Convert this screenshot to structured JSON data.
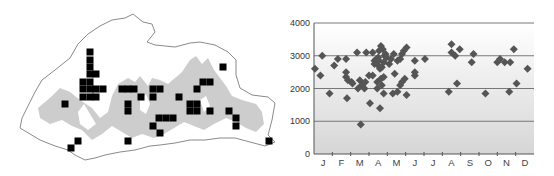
{
  "map": {
    "title": "",
    "outline_color": "#888888",
    "relief_color": "#cfcfcf",
    "marker_color": "#000000",
    "marker_size": 7,
    "records": [
      [
        90,
        52
      ],
      [
        90,
        60
      ],
      [
        90,
        67
      ],
      [
        90,
        74
      ],
      [
        96,
        74
      ],
      [
        83,
        82
      ],
      [
        90,
        82
      ],
      [
        83,
        89
      ],
      [
        90,
        89
      ],
      [
        96,
        89
      ],
      [
        103,
        89
      ],
      [
        83,
        97
      ],
      [
        90,
        97
      ],
      [
        96,
        97
      ],
      [
        65,
        104
      ],
      [
        122,
        89
      ],
      [
        128,
        89
      ],
      [
        134,
        89
      ],
      [
        141,
        97
      ],
      [
        128,
        104
      ],
      [
        128,
        111
      ],
      [
        153,
        89
      ],
      [
        160,
        89
      ],
      [
        153,
        97
      ],
      [
        179,
        97
      ],
      [
        159,
        118
      ],
      [
        166,
        118
      ],
      [
        173,
        118
      ],
      [
        153,
        126
      ],
      [
        160,
        133
      ],
      [
        128,
        141
      ],
      [
        78,
        141
      ],
      [
        71,
        148
      ],
      [
        223,
        67
      ],
      [
        203,
        82
      ],
      [
        210,
        82
      ],
      [
        197,
        89
      ],
      [
        190,
        104
      ],
      [
        197,
        104
      ],
      [
        190,
        111
      ],
      [
        197,
        111
      ],
      [
        210,
        111
      ],
      [
        229,
        111
      ],
      [
        236,
        118
      ],
      [
        236,
        126
      ],
      [
        269,
        141
      ]
    ]
  },
  "chart_data": {
    "type": "scatter",
    "title": "",
    "xlabel": "",
    "ylabel": "",
    "categories": [
      "J",
      "F",
      "M",
      "A",
      "M",
      "J",
      "J",
      "A",
      "S",
      "O",
      "N",
      "D"
    ],
    "yticks": [
      0,
      1000,
      2000,
      3000,
      4000
    ],
    "ylim": [
      0,
      4000
    ],
    "xlim": [
      0,
      12
    ],
    "grid": true,
    "marker_color": "#555555",
    "gridline_color": "#777777",
    "background_gradient": [
      "#ffffff",
      "#d8d8d8"
    ],
    "series": [
      {
        "name": "records",
        "points": [
          [
            0.05,
            2600
          ],
          [
            0.35,
            2400
          ],
          [
            0.45,
            3000
          ],
          [
            0.85,
            1850
          ],
          [
            1.1,
            2700
          ],
          [
            1.3,
            2900
          ],
          [
            1.75,
            2900
          ],
          [
            1.75,
            2500
          ],
          [
            1.75,
            2350
          ],
          [
            1.8,
            1700
          ],
          [
            1.85,
            2250
          ],
          [
            2.05,
            2200
          ],
          [
            2.1,
            2150
          ],
          [
            2.35,
            3100
          ],
          [
            2.4,
            2000
          ],
          [
            2.5,
            2250
          ],
          [
            2.55,
            900
          ],
          [
            2.6,
            2100
          ],
          [
            2.75,
            2000
          ],
          [
            2.8,
            2200
          ],
          [
            2.85,
            3100
          ],
          [
            3.0,
            2400
          ],
          [
            3.05,
            1550
          ],
          [
            3.2,
            3100
          ],
          [
            3.2,
            2400
          ],
          [
            3.3,
            2850
          ],
          [
            3.3,
            2750
          ],
          [
            3.4,
            2900
          ],
          [
            3.45,
            2000
          ],
          [
            3.45,
            2200
          ],
          [
            3.5,
            2700
          ],
          [
            3.5,
            2950
          ],
          [
            3.55,
            3150
          ],
          [
            3.55,
            2850
          ],
          [
            3.6,
            2600
          ],
          [
            3.6,
            1400
          ],
          [
            3.65,
            3300
          ],
          [
            3.65,
            2300
          ],
          [
            3.7,
            2100
          ],
          [
            3.7,
            2650
          ],
          [
            3.75,
            3200
          ],
          [
            3.8,
            2800
          ],
          [
            3.8,
            1850
          ],
          [
            3.8,
            2350
          ],
          [
            3.85,
            3000
          ],
          [
            3.9,
            3050
          ],
          [
            3.95,
            2950
          ],
          [
            4.1,
            2750
          ],
          [
            4.2,
            2900
          ],
          [
            4.3,
            1850
          ],
          [
            4.35,
            3050
          ],
          [
            4.4,
            2450
          ],
          [
            4.55,
            1900
          ],
          [
            4.55,
            2850
          ],
          [
            4.7,
            2900
          ],
          [
            4.7,
            2100
          ],
          [
            4.8,
            3050
          ],
          [
            4.8,
            2200
          ],
          [
            4.9,
            3150
          ],
          [
            4.95,
            2300
          ],
          [
            5.05,
            3250
          ],
          [
            5.05,
            1800
          ],
          [
            5.5,
            2400
          ],
          [
            5.5,
            2500
          ],
          [
            5.5,
            2850
          ],
          [
            6.05,
            2900
          ],
          [
            7.35,
            1900
          ],
          [
            7.5,
            3350
          ],
          [
            7.5,
            3100
          ],
          [
            7.7,
            3000
          ],
          [
            7.8,
            2150
          ],
          [
            7.95,
            3200
          ],
          [
            8.6,
            2800
          ],
          [
            8.7,
            3050
          ],
          [
            9.35,
            1850
          ],
          [
            10.0,
            2800
          ],
          [
            10.15,
            2900
          ],
          [
            10.4,
            2800
          ],
          [
            10.65,
            1900
          ],
          [
            10.7,
            2800
          ],
          [
            10.9,
            3200
          ],
          [
            11.05,
            2150
          ],
          [
            11.65,
            2600
          ]
        ]
      }
    ]
  }
}
